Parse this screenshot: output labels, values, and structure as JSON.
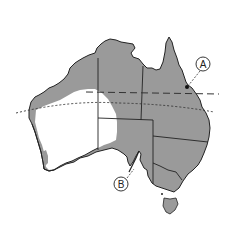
{
  "map": {
    "subject": "Australia",
    "colors": {
      "land_shaded": "#9a9a9a",
      "land_unshaded": "#ffffff",
      "border": "#222222",
      "background": "#ffffff"
    },
    "regions": [
      {
        "name": "Western Australia"
      },
      {
        "name": "Northern Territory"
      },
      {
        "name": "Queensland"
      },
      {
        "name": "South Australia"
      },
      {
        "name": "New South Wales"
      },
      {
        "name": "Victoria"
      },
      {
        "name": "Tasmania"
      }
    ],
    "lines": [
      {
        "name": "long-dashed-latitude",
        "style": "long dashed"
      },
      {
        "name": "dotted-latitude",
        "style": "dotted"
      }
    ],
    "callouts": [
      {
        "id": "A",
        "label": "A"
      },
      {
        "id": "B",
        "label": "B"
      }
    ]
  }
}
